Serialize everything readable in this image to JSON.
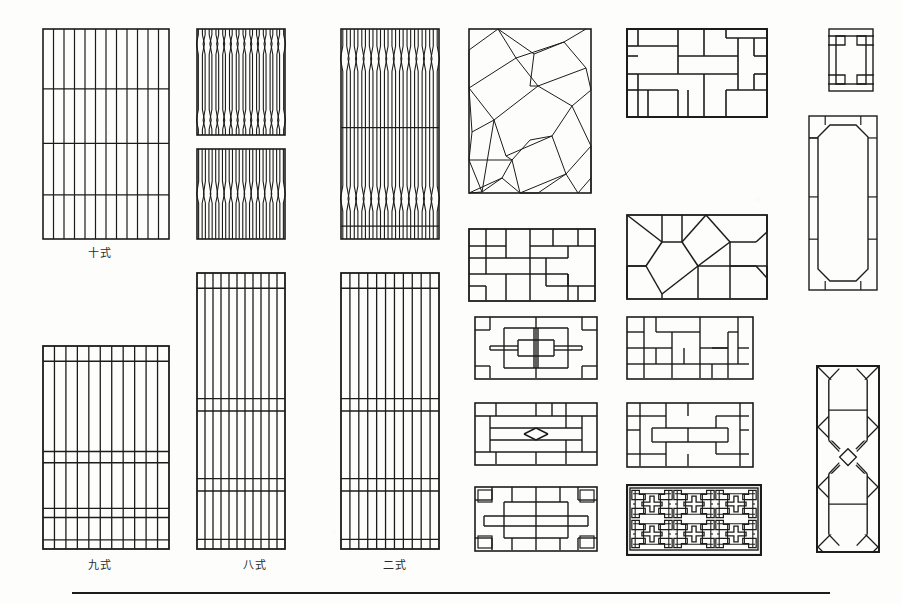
{
  "page": {
    "background_color": "#fdfdfc",
    "ink_color": "#1c1c1c",
    "width": 902,
    "height": 604,
    "footer_rule": true
  },
  "captions": [
    {
      "id": "cap-shi-shi",
      "text": "十式",
      "x": 60,
      "y": 244,
      "w": 80
    },
    {
      "id": "cap-jiu-shi",
      "text": "九式",
      "x": 60,
      "y": 556,
      "w": 80
    },
    {
      "id": "cap-ba-shi",
      "text": "八式",
      "x": 215,
      "y": 556,
      "w": 80
    },
    {
      "id": "cap-er-shi",
      "text": "二式",
      "x": 355,
      "y": 556,
      "w": 80
    }
  ],
  "figures": [
    {
      "id": "fig-vertical-mullion-10",
      "name": "vertical-mullion-panel-style-10",
      "type": "vertical-mullion",
      "x": 42,
      "y": 28,
      "w": 128,
      "h": 212,
      "bars": 12,
      "rails": [
        0.285,
        0.545,
        0.79
      ]
    },
    {
      "id": "fig-vertical-mullion-9",
      "name": "vertical-mullion-panel-style-9",
      "type": "vertical-mullion-banded",
      "x": 42,
      "y": 345,
      "w": 128,
      "h": 205,
      "bars": 11,
      "bands": [
        0.075,
        0.52,
        0.575,
        0.8,
        0.845,
        0.955
      ]
    },
    {
      "id": "fig-lens-lattice-top",
      "name": "lens-bulge-lattice-upper",
      "type": "lens-lattice",
      "x": 196,
      "y": 28,
      "w": 90,
      "h": 108,
      "bars": 13
    },
    {
      "id": "fig-lens-lattice-bottom",
      "name": "lens-bulge-lattice-lower",
      "type": "chevron-lattice",
      "x": 196,
      "y": 148,
      "w": 90,
      "h": 92,
      "bars": 13
    },
    {
      "id": "fig-vertical-mullion-8",
      "name": "vertical-mullion-panel-style-8",
      "type": "vertical-mullion-banded",
      "x": 196,
      "y": 272,
      "w": 90,
      "h": 278,
      "bars": 11,
      "bands": [
        0.055,
        0.455,
        0.5,
        0.745,
        0.79,
        0.965
      ]
    },
    {
      "id": "fig-pointed-lattice-top",
      "name": "pointed-bulge-lattice-upper",
      "type": "point-lattice",
      "x": 340,
      "y": 28,
      "w": 100,
      "h": 212,
      "bars": 13
    },
    {
      "id": "fig-vertical-mullion-2",
      "name": "vertical-mullion-panel-style-2",
      "type": "vertical-mullion-banded",
      "x": 340,
      "y": 272,
      "w": 100,
      "h": 278,
      "bars": 11,
      "bands": [
        0.055,
        0.455,
        0.5,
        0.745,
        0.79,
        0.965
      ]
    },
    {
      "id": "fig-ice-crack",
      "name": "ice-crack-lattice",
      "type": "ice-crack",
      "x": 468,
      "y": 28,
      "w": 124,
      "h": 166
    },
    {
      "id": "fig-gong-brick-large",
      "name": "gong-character-brick-lattice",
      "type": "gong-brick",
      "x": 626,
      "y": 28,
      "w": 142,
      "h": 90
    },
    {
      "id": "fig-corner-bracket-small",
      "name": "corner-bracket-panel-small",
      "type": "corner-bracket",
      "x": 828,
      "y": 28,
      "w": 46,
      "h": 64
    },
    {
      "id": "fig-chamfered-tall",
      "name": "chamfered-rectangle-tall-panel",
      "type": "chamfered-tall",
      "x": 808,
      "y": 115,
      "w": 70,
      "h": 176
    },
    {
      "id": "fig-cross-brick",
      "name": "cross-brick-lattice",
      "type": "cross-brick",
      "x": 468,
      "y": 228,
      "w": 128,
      "h": 74
    },
    {
      "id": "fig-polygon-facet",
      "name": "polygon-facet-lattice",
      "type": "polygon-facet",
      "x": 626,
      "y": 214,
      "w": 142,
      "h": 86
    },
    {
      "id": "fig-fret-a",
      "name": "fret-lattice-symmetric",
      "type": "fret-a",
      "x": 474,
      "y": 316,
      "w": 124,
      "h": 64
    },
    {
      "id": "fig-fret-b",
      "name": "fret-lattice-interlock",
      "type": "fret-b",
      "x": 626,
      "y": 316,
      "w": 128,
      "h": 64
    },
    {
      "id": "fig-bowtie",
      "name": "bowtie-brick-lattice",
      "type": "bowtie",
      "x": 474,
      "y": 402,
      "w": 124,
      "h": 64
    },
    {
      "id": "fig-nested-fret",
      "name": "nested-rectangle-fret-lattice",
      "type": "nested-fret",
      "x": 626,
      "y": 402,
      "w": 128,
      "h": 66
    },
    {
      "id": "fig-overlap-bars",
      "name": "overlapping-bar-lattice",
      "type": "overlap-bars",
      "x": 474,
      "y": 486,
      "w": 124,
      "h": 66
    },
    {
      "id": "fig-wan-maze",
      "name": "wan-character-maze-lattice",
      "type": "wan-maze",
      "x": 626,
      "y": 484,
      "w": 136,
      "h": 72
    },
    {
      "id": "fig-diagonal-h",
      "name": "diagonal-lattice-with-h-motif",
      "type": "diagonal-h",
      "x": 816,
      "y": 365,
      "w": 64,
      "h": 188
    }
  ]
}
